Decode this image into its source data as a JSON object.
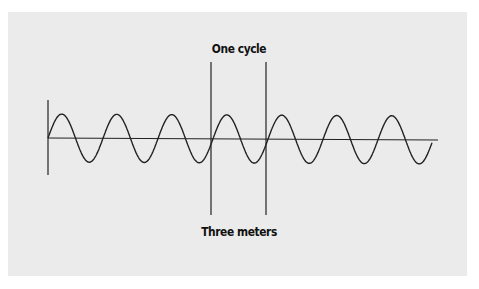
{
  "diagram": {
    "top_label": "One cycle",
    "bottom_label": "Three meters",
    "colors": {
      "background": "#ffffff",
      "panel": "#ebebeb",
      "line": "#222222"
    },
    "wave": {
      "cycles": 7,
      "start_x": 48,
      "period_px": 55,
      "axis_y": 139,
      "amplitude_px": 24
    },
    "cycle_markers": {
      "left_x": 211,
      "right_x": 266,
      "top_y": 62,
      "bottom_y": 215
    }
  }
}
